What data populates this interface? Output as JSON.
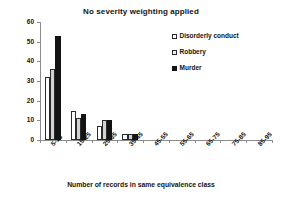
{
  "chart_data": {
    "type": "bar",
    "title": "No severity weighting applied",
    "xlabel": "Number of records in same equivalence class",
    "ylabel": "Frequency count",
    "categories": [
      "5-15",
      "15-25",
      "25-35",
      "35-45",
      "45-55",
      "55-65",
      "65-75",
      "75-85",
      "85-95"
    ],
    "series": [
      {
        "name": "Disorderly conduct",
        "color": "#ffffff",
        "values": [
          32,
          15,
          7,
          3,
          0,
          0,
          0,
          0,
          0
        ]
      },
      {
        "name": "Robbery",
        "color": "#d2d2d2",
        "values": [
          36,
          11,
          10,
          3,
          0,
          0,
          0,
          0,
          0
        ]
      },
      {
        "name": "Murder",
        "color": "#131313",
        "values": [
          53,
          13,
          10,
          3,
          0,
          0,
          0,
          0,
          0
        ]
      }
    ],
    "ylim": [
      0,
      60
    ],
    "yticks": [
      0,
      10,
      20,
      30,
      40,
      50,
      60
    ],
    "ytick_labels": [
      "0",
      "10",
      "20",
      "30",
      "40",
      "50",
      "60"
    ],
    "grid": false,
    "legend_position": "top-right",
    "xtick_label_rotation": -45
  }
}
